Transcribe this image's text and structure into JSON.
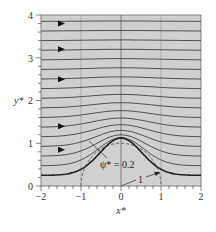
{
  "chart_data": {
    "type": "line",
    "title": "",
    "subtitle": "Streamlines for uniform flow over a cylinder near a wall (stream function contours)",
    "xlabel": "x*",
    "ylabel": "y*",
    "xlim": [
      -2,
      2
    ],
    "ylim": [
      0,
      4
    ],
    "x_ticks": [
      -2,
      -1,
      0,
      1,
      2
    ],
    "y_ticks": [
      0,
      1,
      2,
      3,
      4
    ],
    "grid": true,
    "legend": null,
    "annotations": [
      {
        "text": "ψ* = 0.2",
        "target": "bold streamline",
        "position": [
          0.05,
          0.55
        ]
      },
      {
        "text": "1",
        "target": "dashed circle (radius 1)",
        "position": [
          0.55,
          0.35
        ]
      }
    ],
    "series": [
      {
        "name": "streamline psi=0.2 (bold)",
        "style": "solid-bold",
        "description": "y ≈ 0.25 at x=±2, rising to ≈1.1 at x=0"
      },
      {
        "name": "dashed circle",
        "style": "dashed",
        "description": "circle of radius 1 centered at (0,0)"
      },
      {
        "name": "streamlines",
        "style": "solid",
        "count": 16,
        "description": "stream function contours between psi=0.2 and top; approach uniform horizontal at top"
      }
    ],
    "flow_direction_arrows": [
      {
        "x": -1.5,
        "y": 3.8
      },
      {
        "x": -1.5,
        "y": 3.2
      },
      {
        "x": -1.5,
        "y": 2.5
      },
      {
        "x": -1.5,
        "y": 1.4
      },
      {
        "x": -1.5,
        "y": 0.85
      }
    ]
  },
  "labels": {
    "x_axis": "x*",
    "y_axis": "y*",
    "psi_label": "ψ* = 0.2",
    "radius_label": "1",
    "x_ticks": [
      "−2",
      "−1",
      "0",
      "1",
      "2"
    ],
    "y_ticks": [
      "0",
      "1",
      "2",
      "3",
      "4"
    ]
  }
}
